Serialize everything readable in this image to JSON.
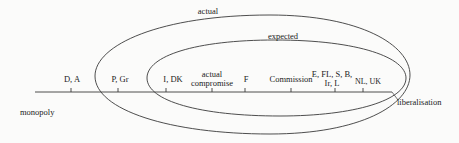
{
  "diagram": {
    "axis": {
      "left_label": "monopoly",
      "right_label": "liberalisation"
    },
    "ellipses": [
      {
        "label": "actual"
      },
      {
        "label": "expected"
      }
    ],
    "positions": [
      {
        "label": "D, A"
      },
      {
        "label": "P, Gr"
      },
      {
        "label": "I, DK"
      },
      {
        "label_line1": "actual",
        "label_line2": "compromise"
      },
      {
        "label": "F"
      },
      {
        "label": "Commission"
      },
      {
        "label_line1": "E, FL, S, B,",
        "label_line2": "Ir, L"
      },
      {
        "label_main": "NL, UK"
      }
    ]
  },
  "colors": {
    "line": "#3a3a3a",
    "text": "#222222",
    "background": "#fbfbfa"
  }
}
